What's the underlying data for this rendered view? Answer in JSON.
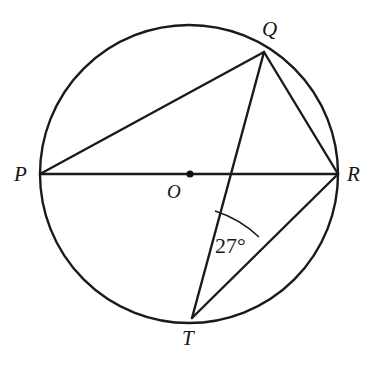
{
  "figure": {
    "kind": "circle-geometry-diagram",
    "background_color": "#ffffff",
    "stroke_color": "#1a1a1a",
    "stroke_width": 2.4,
    "label_color": "#151515"
  },
  "circle": {
    "center_x": 189,
    "center_y": 174,
    "radius": 149
  },
  "center_dot": {
    "x": 190,
    "y": 174,
    "radius": 3.6
  },
  "points": {
    "P": {
      "label": "P",
      "x": 40,
      "y": 174
    },
    "Q": {
      "label": "Q",
      "x": 264,
      "y": 52
    },
    "R": {
      "label": "R",
      "x": 338,
      "y": 174
    },
    "T": {
      "label": "T",
      "x": 192,
      "y": 318
    },
    "O": {
      "label": "O",
      "x": 190,
      "y": 174
    }
  },
  "segments": [
    {
      "name": "PR",
      "from": "P",
      "to": "R",
      "note": "diameter"
    },
    {
      "name": "PQ",
      "from": "P",
      "to": "Q",
      "note": "chord"
    },
    {
      "name": "QR",
      "from": "Q",
      "to": "R",
      "note": "chord"
    },
    {
      "name": "QT",
      "from": "Q",
      "to": "T",
      "note": "chord"
    },
    {
      "name": "TR",
      "from": "T",
      "to": "R",
      "note": "chord"
    }
  ],
  "angle_marker": {
    "label": "27°",
    "value": 27,
    "unit": "degrees",
    "at_vertex": "T",
    "between": [
      "TQ",
      "TR"
    ],
    "arc_radius": 113,
    "arc_start_x": 215,
    "arc_start_y": 211,
    "arc_end_x": 259,
    "arc_end_y": 237
  }
}
